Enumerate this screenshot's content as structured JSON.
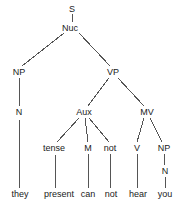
{
  "diagram": {
    "type": "constituency-syntax-tree",
    "sentence": "they present can not hear you",
    "background_color": "#ffffff",
    "line_color": "#555555",
    "text_color": "#1a1a1a",
    "width": 176,
    "height": 208
  },
  "nodes": [
    {
      "id": "S",
      "label": "S",
      "x": 72,
      "y": 9,
      "level": 0,
      "kind": "nonterminal"
    },
    {
      "id": "Nuc",
      "label": "Nuc",
      "x": 70,
      "y": 28,
      "level": 1,
      "kind": "nonterminal"
    },
    {
      "id": "NP1",
      "label": "NP",
      "x": 19,
      "y": 72,
      "level": 2,
      "kind": "nonterminal"
    },
    {
      "id": "VP",
      "label": "VP",
      "x": 113,
      "y": 72,
      "level": 2,
      "kind": "nonterminal"
    },
    {
      "id": "N1",
      "label": "N",
      "x": 19,
      "y": 112,
      "level": 3,
      "kind": "nonterminal"
    },
    {
      "id": "Aux",
      "label": "Aux",
      "x": 84,
      "y": 112,
      "level": 3,
      "kind": "nonterminal"
    },
    {
      "id": "MV",
      "label": "MV",
      "x": 147,
      "y": 112,
      "level": 3,
      "kind": "nonterminal"
    },
    {
      "id": "tense",
      "label": "tense",
      "x": 54,
      "y": 148,
      "level": 4,
      "kind": "nonterminal"
    },
    {
      "id": "M",
      "label": "M",
      "x": 88,
      "y": 148,
      "level": 4,
      "kind": "nonterminal"
    },
    {
      "id": "notnode",
      "label": "not",
      "x": 110,
      "y": 148,
      "level": 4,
      "kind": "nonterminal"
    },
    {
      "id": "V",
      "label": "V",
      "x": 137,
      "y": 148,
      "level": 4,
      "kind": "nonterminal"
    },
    {
      "id": "NP2",
      "label": "NP",
      "x": 164,
      "y": 148,
      "level": 4,
      "kind": "nonterminal"
    },
    {
      "id": "N2",
      "label": "N",
      "x": 165,
      "y": 171,
      "level": 5,
      "kind": "nonterminal"
    }
  ],
  "terminals": [
    {
      "id": "t-they",
      "label": "they",
      "x": 20,
      "y": 194,
      "parent": "N1"
    },
    {
      "id": "t-present",
      "label": "present",
      "x": 59,
      "y": 194,
      "parent": "tense"
    },
    {
      "id": "t-can",
      "label": "can",
      "x": 88,
      "y": 194,
      "parent": "M"
    },
    {
      "id": "t-not",
      "label": "not",
      "x": 111,
      "y": 194,
      "parent": "notnode"
    },
    {
      "id": "t-hear",
      "label": "hear",
      "x": 138,
      "y": 194,
      "parent": "V"
    },
    {
      "id": "t-you",
      "label": "you",
      "x": 165,
      "y": 194,
      "parent": "N2"
    }
  ],
  "edges": [
    {
      "id": "e-s-nuc",
      "from": "S",
      "to": "Nuc",
      "x1": 72,
      "y1": 14,
      "x2": 72,
      "y2": 22
    },
    {
      "id": "e-nuc-np",
      "from": "Nuc",
      "to": "NP1",
      "x1": 64,
      "y1": 33,
      "x2": 22,
      "y2": 66
    },
    {
      "id": "e-nuc-vp",
      "from": "Nuc",
      "to": "VP",
      "x1": 79,
      "y1": 33,
      "x2": 110,
      "y2": 66
    },
    {
      "id": "e-np-n",
      "from": "NP1",
      "to": "N1",
      "x1": 19,
      "y1": 78,
      "x2": 19,
      "y2": 106
    },
    {
      "id": "e-n-they",
      "from": "N1",
      "to": "t-they",
      "x1": 19,
      "y1": 118,
      "x2": 20,
      "y2": 188
    },
    {
      "id": "e-vp-aux",
      "from": "VP",
      "to": "Aux",
      "x1": 109,
      "y1": 78,
      "x2": 88,
      "y2": 106
    },
    {
      "id": "e-vp-mv",
      "from": "VP",
      "to": "MV",
      "x1": 118,
      "y1": 78,
      "x2": 144,
      "y2": 106
    },
    {
      "id": "e-aux-tense",
      "from": "Aux",
      "to": "tense",
      "x1": 79,
      "y1": 118,
      "x2": 57,
      "y2": 142
    },
    {
      "id": "e-aux-m",
      "from": "Aux",
      "to": "M",
      "x1": 85,
      "y1": 118,
      "x2": 88,
      "y2": 142
    },
    {
      "id": "e-aux-not",
      "from": "Aux",
      "to": "notnode",
      "x1": 89,
      "y1": 118,
      "x2": 109,
      "y2": 142
    },
    {
      "id": "e-mv-v",
      "from": "MV",
      "to": "V",
      "x1": 144,
      "y1": 118,
      "x2": 137,
      "y2": 142
    },
    {
      "id": "e-mv-np",
      "from": "MV",
      "to": "NP2",
      "x1": 150,
      "y1": 118,
      "x2": 162,
      "y2": 142
    },
    {
      "id": "e-tense-present",
      "from": "tense",
      "to": "t-present",
      "x1": 55,
      "y1": 154,
      "x2": 56,
      "y2": 188
    },
    {
      "id": "e-m-can",
      "from": "M",
      "to": "t-can",
      "x1": 88,
      "y1": 154,
      "x2": 88,
      "y2": 188
    },
    {
      "id": "e-not-not",
      "from": "notnode",
      "to": "t-not",
      "x1": 110,
      "y1": 154,
      "x2": 110,
      "y2": 188
    },
    {
      "id": "e-v-hear",
      "from": "V",
      "to": "t-hear",
      "x1": 137,
      "y1": 154,
      "x2": 137,
      "y2": 188
    },
    {
      "id": "e-np2-n2",
      "from": "NP2",
      "to": "N2",
      "x1": 164,
      "y1": 154,
      "x2": 165,
      "y2": 165
    },
    {
      "id": "e-n2-you",
      "from": "N2",
      "to": "t-you",
      "x1": 165,
      "y1": 177,
      "x2": 165,
      "y2": 188
    }
  ]
}
